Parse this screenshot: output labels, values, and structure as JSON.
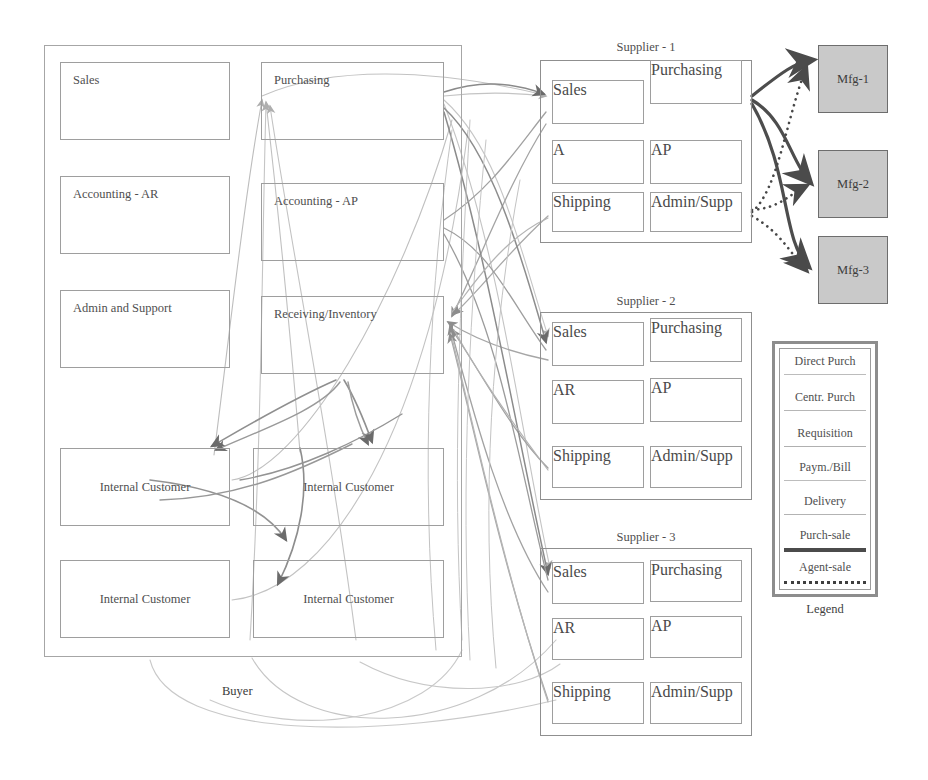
{
  "diagram": {
    "buyer": {
      "caption": "Buyer",
      "departments": [
        {
          "id": "sales",
          "label": "Sales"
        },
        {
          "id": "purchasing",
          "label": "Purchasing"
        },
        {
          "id": "accounting-ar",
          "label": "Accounting - AR"
        },
        {
          "id": "accounting-ap",
          "label": "Accounting - AP"
        },
        {
          "id": "admin-support",
          "label": "Admin and Support"
        },
        {
          "id": "receiving-inventory",
          "label": "Receiving/Inventory"
        },
        {
          "id": "internal-customer-1",
          "label": "Internal Customer"
        },
        {
          "id": "internal-customer-2",
          "label": "Internal Customer"
        },
        {
          "id": "internal-customer-3",
          "label": "Internal Customer"
        },
        {
          "id": "internal-customer-4",
          "label": "Internal Customer"
        }
      ]
    },
    "suppliers": [
      {
        "id": "supplier-1",
        "title": "Supplier - 1",
        "units": [
          "Sales",
          "Purchasing",
          "A",
          "AP",
          "Shipping",
          "Admin/Supp"
        ]
      },
      {
        "id": "supplier-2",
        "title": "Supplier - 2",
        "units": [
          "Sales",
          "Purchasing",
          "AR",
          "AP",
          "Shipping",
          "Admin/Supp"
        ]
      },
      {
        "id": "supplier-3",
        "title": "Supplier - 3",
        "units": [
          "Sales",
          "Purchasing",
          "AR",
          "AP",
          "Shipping",
          "Admin/Supp"
        ]
      }
    ],
    "manufacturers": [
      {
        "id": "mfg-1",
        "label": "Mfg-1"
      },
      {
        "id": "mfg-2",
        "label": "Mfg-2"
      },
      {
        "id": "mfg-3",
        "label": "Mfg-3"
      }
    ],
    "legend": {
      "caption": "Legend",
      "entries": [
        {
          "label": "Direct Purch",
          "style": "thin-solid-light",
          "color": "#b9b9b9"
        },
        {
          "label": "Centr. Purch",
          "style": "thin-solid-light",
          "color": "#b5b5b5"
        },
        {
          "label": "Requisition",
          "style": "thin-solid-light",
          "color": "#b0b0b0"
        },
        {
          "label": "Paym./Bill",
          "style": "thin-solid-light",
          "color": "#bcbcbc"
        },
        {
          "label": "Delivery",
          "style": "thin-solid-light",
          "color": "#b2b2b2"
        },
        {
          "label": "Purch-sale",
          "style": "thick-solid-dark",
          "color": "#4b4b4b"
        },
        {
          "label": "Agent-sale",
          "style": "dotted-dark",
          "color": "#3f3f3f"
        }
      ]
    },
    "colors": {
      "mfg_fill": "#c9c9c9",
      "box_border": "#9e9e9e",
      "wire_light": "#bdbdbd",
      "wire_mid": "#9b9b9b",
      "wire_dark": "#6f6f6f",
      "wire_solid_black": "#4b4b4b",
      "text": "#4f4f4f"
    }
  }
}
